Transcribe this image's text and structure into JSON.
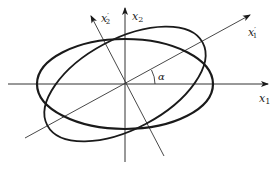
{
  "diagram": {
    "title": "",
    "rotation_angle_label": "α",
    "rotation_angle_deg": 28,
    "axes": {
      "x1": {
        "base": "x",
        "sub": "1",
        "prime": ""
      },
      "x2": {
        "base": "x",
        "sub": "2",
        "prime": ""
      },
      "x1p": {
        "base": "x",
        "sub": "1",
        "prime": "′"
      },
      "x2p": {
        "base": "x",
        "sub": "2",
        "prime": "′"
      }
    },
    "ellipses": [
      {
        "name": "aligned-ellipse",
        "semi_major": 88,
        "semi_minor": 45,
        "rotation_deg": 0
      },
      {
        "name": "rotated-ellipse",
        "semi_major": 88,
        "semi_minor": 45,
        "rotation_deg": 28
      }
    ],
    "colors": {
      "stroke": "#1a1a1a",
      "axis": "#333333",
      "background": "#ffffff"
    }
  }
}
